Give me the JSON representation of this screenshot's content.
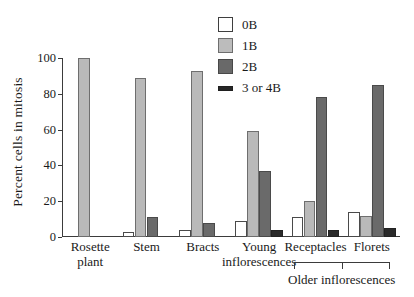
{
  "chart_data": {
    "type": "bar",
    "title": "",
    "subtitle": "",
    "xlabel": "",
    "ylabel": "Percent cells in mitosis",
    "ylim": [
      0,
      100
    ],
    "yticks": [
      0,
      20,
      40,
      60,
      80,
      100
    ],
    "ytick_labels": [
      "0",
      "20",
      "40",
      "60",
      "80",
      "100"
    ],
    "grid": false,
    "legend_position": "top-center",
    "categories": [
      "Rosette\nplant",
      "Stem",
      "Bracts",
      "Young\ninflorescences",
      "Receptacles",
      "Florets"
    ],
    "category_labels_flat": [
      "Rosette plant",
      "Stem",
      "Bracts",
      "Young inflorescences",
      "Receptacles",
      "Florets"
    ],
    "series": [
      {
        "name": "0B",
        "color": "#ffffff",
        "values": [
          0,
          3,
          4,
          9,
          11,
          14
        ]
      },
      {
        "name": "1B",
        "color": "#b9b9b9",
        "values": [
          100,
          89,
          93,
          59,
          20,
          12
        ]
      },
      {
        "name": "2B",
        "color": "#6a6a6a",
        "values": [
          0,
          11,
          8,
          37,
          78,
          85
        ]
      },
      {
        "name": "3 or 4B",
        "color": "#2a2a2a",
        "values": [
          0,
          0,
          0,
          4,
          4,
          5
        ]
      }
    ],
    "annotations": [
      {
        "text": "Older inflorescences",
        "spans_categories": [
          "Receptacles",
          "Florets"
        ],
        "style": "bracket-below-axis"
      }
    ]
  },
  "legend": {
    "items": [
      {
        "label": "0B"
      },
      {
        "label": "1B"
      },
      {
        "label": "2B"
      },
      {
        "label": "3 or 4B"
      }
    ]
  },
  "axis": {
    "y_title": "Percent cells in mitosis",
    "y_ticks": [
      "100",
      "80",
      "60",
      "40",
      "20",
      "0"
    ]
  },
  "bracket": {
    "label": "Older inflorescences"
  }
}
